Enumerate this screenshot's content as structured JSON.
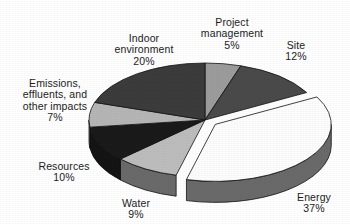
{
  "chart_data": {
    "type": "pie",
    "title": "",
    "subtitle": "",
    "xlabel": "",
    "ylabel": "",
    "legend_position": "none",
    "grid": false,
    "style": "3d-exploded-grayscale",
    "units": "percent",
    "total": 100,
    "exploded_slices": [
      "Energy"
    ],
    "start_angle_deg": 0,
    "direction": "clockwise",
    "categories": [
      "Project management",
      "Site",
      "Energy",
      "Water",
      "Resources",
      "Emissions, effluents, and other impacts",
      "Indoor environment"
    ],
    "values": [
      5,
      12,
      37,
      9,
      10,
      7,
      20
    ],
    "slices": [
      {
        "label": "Project management",
        "label_lines": [
          "Project",
          "management"
        ],
        "value": 5,
        "value_text": "5%",
        "color": "#9c9c9c",
        "side_color": "#6f6f6f",
        "exploded": false
      },
      {
        "label": "Site",
        "label_lines": [
          "Site"
        ],
        "value": 12,
        "value_text": "12%",
        "color": "#4a4a4a",
        "side_color": "#3a3a3a",
        "exploded": false
      },
      {
        "label": "Energy",
        "label_lines": [
          "Energy"
        ],
        "value": 37,
        "value_text": "37%",
        "color": "#fdfdfd",
        "side_color": "#6a6a6a",
        "exploded": true
      },
      {
        "label": "Water",
        "label_lines": [
          "Water"
        ],
        "value": 9,
        "value_text": "9%",
        "color": "#bdbdbd",
        "side_color": "#6a6a6a",
        "exploded": false
      },
      {
        "label": "Resources",
        "label_lines": [
          "Resources"
        ],
        "value": 10,
        "value_text": "10%",
        "color": "#1a1a1a",
        "side_color": "#141414",
        "exploded": false
      },
      {
        "label": "Emissions, effluents, and other impacts",
        "label_lines": [
          "Emissions,",
          "effluents, and",
          "other impacts"
        ],
        "value": 7,
        "value_text": "7%",
        "color": "#b6b6b6",
        "side_color": "#7d7d7d",
        "exploded": false
      },
      {
        "label": "Indoor environment",
        "label_lines": [
          "Indoor",
          "environment"
        ],
        "value": 20,
        "value_text": "20%",
        "color": "#3c3c3c",
        "side_color": "#2e2e2e",
        "exploded": false
      }
    ]
  },
  "labels": {
    "project_management": "Project\nmanagement",
    "project_management_pct": "5%",
    "site": "Site",
    "site_pct": "12%",
    "energy": "Energy",
    "energy_pct": "37%",
    "water": "Water",
    "water_pct": "9%",
    "resources": "Resources",
    "resources_pct": "10%",
    "emissions": "Emissions,\neffluents, and\nother impacts",
    "emissions_pct": "7%",
    "indoor_environment": "Indoor\nenvironment",
    "indoor_environment_pct": "20%"
  },
  "colors": {
    "background": "#ffffff",
    "text": "#1c1c1c",
    "outline": "#000000"
  }
}
